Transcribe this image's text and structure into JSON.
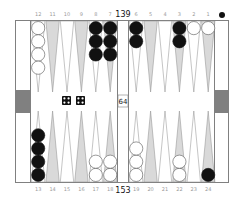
{
  "board": {
    "colors": {
      "frame": "#808080",
      "background": "#ffffff",
      "point_dark": "#d9d9d9",
      "point_light": "#ffffff",
      "point_stroke": "#8a8a8a",
      "bar_marker": "#808080",
      "black_checker": "#111111",
      "white_checker": "#ffffff",
      "white_checker_stroke": "#555555",
      "die_face": "#111111",
      "die_pip": "#ffffff"
    },
    "top_labels": [
      "12",
      "11",
      "10",
      "9",
      "8",
      "7",
      "6",
      "5",
      "4",
      "3",
      "2",
      "1"
    ],
    "bottom_labels": [
      "13",
      "14",
      "15",
      "16",
      "17",
      "18",
      "19",
      "20",
      "21",
      "22",
      "23",
      "24"
    ],
    "top_pip_count": "139",
    "bottom_pip_count": "153",
    "cube_value": "64",
    "turn_indicator": "black",
    "top_points": [
      {
        "label": "12",
        "color": "white",
        "count": 4
      },
      {
        "label": "11",
        "color": null,
        "count": 0
      },
      {
        "label": "10",
        "color": null,
        "count": 0
      },
      {
        "label": "9",
        "color": null,
        "count": 0
      },
      {
        "label": "8",
        "color": "black",
        "count": 3
      },
      {
        "label": "7",
        "color": "black",
        "count": 3
      },
      {
        "label": "6",
        "color": "black",
        "count": 2
      },
      {
        "label": "5",
        "color": null,
        "count": 0
      },
      {
        "label": "4",
        "color": null,
        "count": 0
      },
      {
        "label": "3",
        "color": "black",
        "count": 2
      },
      {
        "label": "2",
        "color": "white",
        "count": 1
      },
      {
        "label": "1",
        "color": "white",
        "count": 1
      }
    ],
    "bottom_points": [
      {
        "label": "13",
        "color": "black",
        "count": 4
      },
      {
        "label": "14",
        "color": null,
        "count": 0
      },
      {
        "label": "15",
        "color": null,
        "count": 0
      },
      {
        "label": "16",
        "color": null,
        "count": 0
      },
      {
        "label": "17",
        "color": "white",
        "count": 2
      },
      {
        "label": "18",
        "color": "white",
        "count": 2
      },
      {
        "label": "19",
        "color": "white",
        "count": 3
      },
      {
        "label": "20",
        "color": null,
        "count": 0
      },
      {
        "label": "21",
        "color": null,
        "count": 0
      },
      {
        "label": "22",
        "color": "white",
        "count": 2
      },
      {
        "label": "23",
        "color": null,
        "count": 0
      },
      {
        "label": "24",
        "color": "black",
        "count": 1
      }
    ],
    "dice": [
      4,
      4
    ]
  }
}
